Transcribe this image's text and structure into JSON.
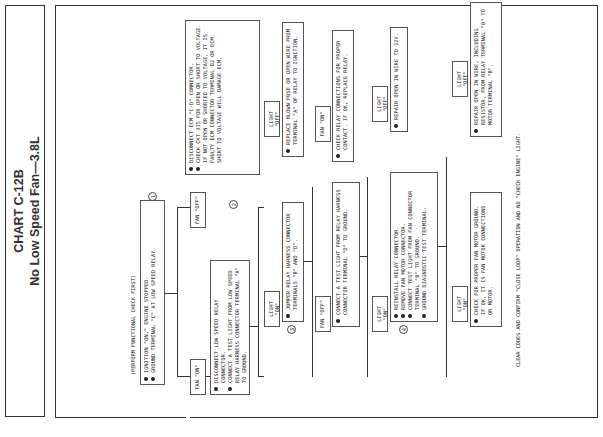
{
  "title": {
    "chart_id": "CHART C-12B",
    "subtitle": "No Low Speed Fan—3.8L"
  },
  "intro": "(PERFORM FUNCTIONAL CHECK FIRST)",
  "steps": {
    "s1": {
      "num": "1",
      "items": [
        "IGNITION \"ON,\" ENGINE STOPPED.",
        "GROUND TERMINAL \"C\" AT LOW SPEED RELAY."
      ]
    },
    "s2": {
      "num": "2",
      "items": [
        "DISCONNECT LOW SPEED RELAY CONNECTOR.",
        "CONNECT A TEST LIGHT FROM LOW SPEED RELAY HARNESS CONNECTOR TERMINAL \"A\" TO GROUND."
      ]
    },
    "s3": {
      "num": "3",
      "items": [
        "JUMPER RELAY HARNESS CONNECTOR TERMINALS \"B\" AND \"D\"."
      ]
    },
    "s4": {
      "num": "4",
      "items": [
        "REINSTALL RELAY CONNECTOR.",
        "REMOVE FAN MOTOR CONNECTOR.",
        "CONNECT TEST LIGHT FROM FAN CONNECTOR TERMINAL \"B\" TO GROUND.",
        "GROUND DIAGNOSTIC TEST TERMINAL."
      ]
    }
  },
  "results": {
    "ecm": {
      "items": [
        "DISCONNECT ECM \"C-D\" CONNECTOR.",
        "CHECK CKT 335 FOR OPEN OR SHORT TO VOLTAGE. IF NOT OPEN OR SHORTED TO VOLTAGE, IT IS FAULTY ECM CONNECTOR TERMINAL D2 OR ECM. SHORT TO VOLTAGE WILL DAMAGE ECM."
      ]
    },
    "fuse": {
      "items": [
        "REPLACE BLOWN FUSE OR OPEN WIRE FROM TERMINAL \"A\" OF RELAY TO IGNITION."
      ]
    },
    "relay_conn": {
      "items": [
        "CHECK RELAY CONNECTIONS FOR PROPER CONTACT. IF OK, REPLACE RELAY."
      ]
    },
    "test_light": {
      "items": [
        "CONNECT A TEST LIGHT FROM RELAY HARNESS CONNECTOR TERMINAL \"D\" TO GROUND."
      ]
    },
    "open_12v": {
      "items": [
        "REPAIR OPEN IN WIRE TO 12V."
      ]
    },
    "open_resistor": {
      "items": [
        "REPAIR OPEN IN WIRE, INCLUDING RESISTOR, FROM RELAY TERMINAL \"B\" TO MOTOR TERMINAL \"B\"."
      ]
    },
    "ground": {
      "items": [
        "CHECK FOR PROPER FAN MOTOR GROUND. IF OK, IT IS FAN MOTOR CONNECTIONS OR MOTOR."
      ]
    }
  },
  "labels": {
    "fan_off_1": "FAN \"OFF\"",
    "fan_on_1": "FAN \"ON\"",
    "light_on_2": "LIGHT \"ON\"",
    "light_off_2": "LIGHT \"OFF\"",
    "fan_off_3": "FAN \"OFF\"",
    "fan_on_3": "FAN \"ON\"",
    "light_on_t": "LIGHT \"ON\"",
    "light_off_t": "LIGHT \"OFF\"",
    "light_on_4": "LIGHT \"ON\"",
    "light_off_4": "LIGHT \"OFF\""
  },
  "footer": "CLEAR CODES AND CONFIRM \"CLOSE LOOP\" OPERATION AND NO \"CHECK ENGINE\" LIGHT."
}
